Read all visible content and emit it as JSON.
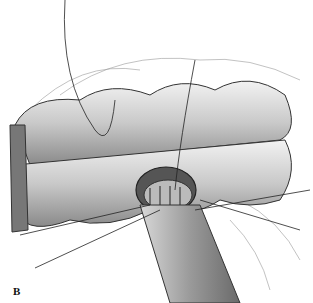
{
  "figure": {
    "panel_label": "B"
  }
}
